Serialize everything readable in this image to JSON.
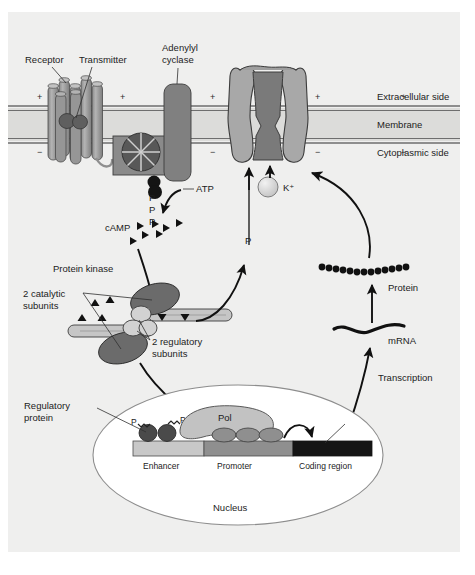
{
  "figure": {
    "background_color": "#ffffff",
    "panel_color": "#efefee"
  },
  "membrane": {
    "labels": {
      "extracellular": "Extracellular side",
      "membrane": "Membrane",
      "cytoplasmic": "Cytoplasmic side"
    },
    "charge_plus": "+",
    "charge_minus": "−",
    "plus_positions_x": [
      40,
      123,
      213,
      318,
      404
    ],
    "minus_positions_x": [
      40,
      123,
      213,
      318,
      404
    ],
    "outer_top_y": 106,
    "inner_top_y": 110,
    "outer_bottom_y": 139,
    "inner_bottom_y": 143
  },
  "components": {
    "receptor": "Receptor",
    "transmitter": "Transmitter",
    "adenylyl_cyclase": "Adenylyl\ncyclase",
    "adenylyl_cyclase_line1": "Adenylyl",
    "adenylyl_cyclase_line2": "cyclase",
    "atp": "ATP",
    "camp": "cAMP",
    "phosphate": "P",
    "phosphate_stack": [
      "P",
      "P",
      "P"
    ],
    "potassium_ion": "K⁺",
    "protein_kinase": "Protein kinase",
    "catalytic_subunits_line1": "2 catalytic",
    "catalytic_subunits_line2": "subunits",
    "regulatory_subunits_line1": "2 regulatory",
    "regulatory_subunits_line2": "subunits",
    "regulatory_protein_line1": "Regulatory",
    "regulatory_protein_line2": "protein",
    "polymerase": "Pol",
    "enhancer": "Enhancer",
    "promoter": "Promoter",
    "coding_region": "Coding region",
    "nucleus": "Nucleus",
    "transcription": "Transcription",
    "mrna": "mRNA",
    "protein": "Protein"
  },
  "colors": {
    "panel": "#efefee",
    "membrane_band": "#dcdcda",
    "membrane_line": "#6e6e6e",
    "receptor_cylinder": "#9a9a9a",
    "receptor_cylinder_dark": "#828282",
    "transmitter_blob": "#5f5f5f",
    "adenylyl_cyclase": "#8a8a8a",
    "g_protein": "#585858",
    "channel_outer": "#a8a8a8",
    "channel_pore": "#7a7a7a",
    "k_ion": "#d8d8d8",
    "catalytic_subunit": "#6b6b6b",
    "regulatory_subunit": "#c6c6c6",
    "nucleus_fill": "#ffffff",
    "nucleus_stroke": "#8d8d8d",
    "dna_enhancer": "#c8c8c8",
    "dna_promoter": "#8f8f8f",
    "dna_coding": "#151515",
    "pol_fill": "#c2c2c2",
    "tf_fill": "#8f8f8f",
    "regprotein_fill": "#4a4a4a",
    "ink": "#111111"
  }
}
